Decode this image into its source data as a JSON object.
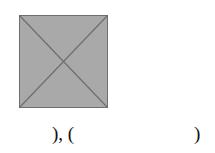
{
  "figure": {
    "shape": "square-with-diagonals",
    "fill_color": "#a9a9a9",
    "stroke_color": "#6e6e6e",
    "diagonals": 2
  },
  "caption": {
    "left_text": "), (",
    "right_text": ")"
  }
}
